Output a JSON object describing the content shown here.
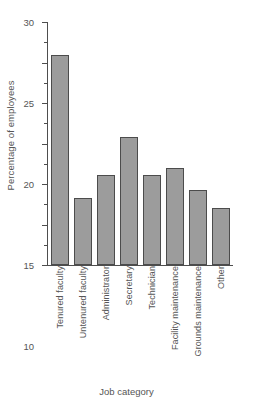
{
  "chart_data": {
    "type": "bar",
    "title": "",
    "subtitle": "",
    "xlabel": "Job category",
    "ylabel": "Percentage of employees",
    "categories": [
      "Tenured faculty",
      "Untenured faculty",
      "Administrator",
      "Secretary",
      "Technician",
      "Facility maintenance",
      "Grounds maintenance",
      "Other"
    ],
    "values": [
      25.9,
      8.3,
      11.1,
      15.8,
      11.1,
      12.0,
      9.2,
      7.1
    ],
    "ylim": [
      0,
      30
    ],
    "yticks": [
      0,
      5,
      10,
      15,
      20,
      25,
      30
    ],
    "ytick_labels": [
      "0",
      "5",
      "10",
      "15",
      "20",
      "25",
      "30"
    ],
    "yminor_ticks": [
      2.5,
      7.5,
      12.5,
      17.5,
      22.5,
      27.5
    ],
    "grid": false,
    "legend": false,
    "legend_position": "none",
    "bar_color": "#9c9c9c",
    "bar_edge_color": "#4c4c4c",
    "axis_color": "#4e4e4e",
    "text_color": "#555555",
    "background_color": "#ffffff",
    "xtick_label_rotation": 90
  }
}
